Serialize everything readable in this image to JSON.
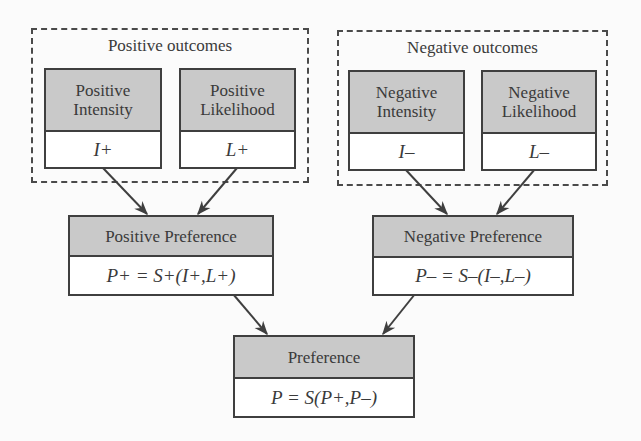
{
  "groups": {
    "positive": {
      "title": "Positive outcomes"
    },
    "negative": {
      "title": "Negative outcomes"
    }
  },
  "nodes": {
    "positive_intensity": {
      "label_line1": "Positive",
      "label_line2": "Intensity",
      "symbol": "I+"
    },
    "positive_likelihood": {
      "label_line1": "Positive",
      "label_line2": "Likelihood",
      "symbol": "L+"
    },
    "negative_intensity": {
      "label_line1": "Negative",
      "label_line2": "Intensity",
      "symbol": "I–"
    },
    "negative_likelihood": {
      "label_line1": "Negative",
      "label_line2": "Likelihood",
      "symbol": "L–"
    },
    "positive_preference": {
      "label": "Positive Preference",
      "formula": "P+ = S+(I+,L+)"
    },
    "negative_preference": {
      "label": "Negative Preference",
      "formula": "P– = S–(I–,L–)"
    },
    "preference": {
      "label": "Preference",
      "formula": "P = S(P+,P–)"
    }
  },
  "edges": [
    {
      "from": "positive_intensity",
      "to": "positive_preference"
    },
    {
      "from": "positive_likelihood",
      "to": "positive_preference"
    },
    {
      "from": "negative_intensity",
      "to": "negative_preference"
    },
    {
      "from": "negative_likelihood",
      "to": "negative_preference"
    },
    {
      "from": "positive_preference",
      "to": "preference"
    },
    {
      "from": "negative_preference",
      "to": "preference"
    }
  ],
  "colors": {
    "header_fill": "#c9c9c9",
    "stroke": "#3f3f3f",
    "text": "#3a3a3a"
  }
}
